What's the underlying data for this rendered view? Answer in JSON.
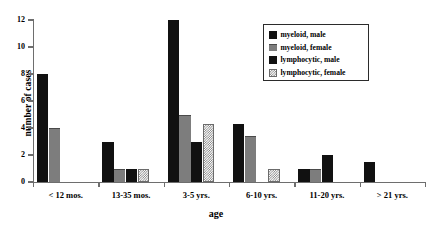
{
  "chart_data": {
    "type": "bar",
    "title": "",
    "xlabel": "age",
    "ylabel": "number of cases",
    "categories": [
      "< 12 mos.",
      "13-35 mos.",
      "3-5 yrs.",
      "6-10 yrs.",
      "11-20 yrs.",
      "> 21 yrs."
    ],
    "ylim": [
      0,
      12
    ],
    "yticks": [
      0,
      2,
      4,
      6,
      8,
      10,
      12
    ],
    "ytick_labels": [
      "0",
      "2",
      "4",
      "6",
      "8",
      "10",
      "12"
    ],
    "grid": false,
    "legend_position": "top-right",
    "series": [
      {
        "name": "myeloid, male",
        "swatch": "solid-black",
        "color": "#111111",
        "values": [
          8,
          3,
          12,
          4.3,
          1,
          1.5
        ]
      },
      {
        "name": "myeloid, female",
        "swatch": "gray",
        "color": "#7d7d7d",
        "values": [
          4,
          1,
          5,
          3.4,
          1,
          0
        ]
      },
      {
        "name": "lymphocytic, male",
        "swatch": "solid-black",
        "color": "#111111",
        "values": [
          0,
          1,
          3,
          0,
          2,
          0
        ]
      },
      {
        "name": "lymphocytic, female",
        "swatch": "checkered",
        "color": "#7a7a7a",
        "values": [
          0,
          1,
          4.3,
          1,
          0,
          0
        ]
      }
    ]
  },
  "axes": {
    "y_title": "number of cases",
    "x_title": "age"
  },
  "legend": {
    "entries": [
      {
        "label": "myeloid, male"
      },
      {
        "label": "myeloid, female"
      },
      {
        "label": "lymphocytic, male"
      },
      {
        "label": "lymphocytic, female"
      }
    ]
  }
}
